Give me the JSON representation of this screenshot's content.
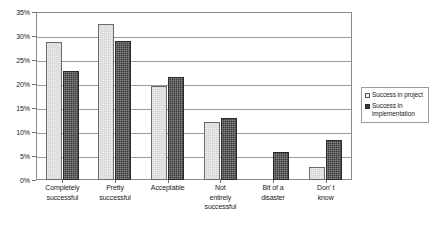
{
  "chart_data": {
    "type": "bar",
    "title": "",
    "subtitle": "",
    "xlabel": "",
    "ylabel": "",
    "ylim": [
      0,
      35
    ],
    "y_tick_step": 5,
    "y_tick_labels": [
      "0%",
      "5%",
      "10%",
      "15%",
      "20%",
      "25%",
      "30%",
      "35%"
    ],
    "y_tick_values": [
      0,
      5,
      10,
      15,
      20,
      25,
      30,
      35
    ],
    "grid": true,
    "grid_axis": "y",
    "legend_position": "right",
    "categories": [
      "Completely successful",
      "Pretty successful",
      "Acceptable",
      "Not entirely successful",
      "Bit of a disaster",
      "Don' t know"
    ],
    "category_lines": [
      [
        "Completely",
        "successful"
      ],
      [
        "Pretty",
        "successful"
      ],
      [
        "Acceptable"
      ],
      [
        "Not",
        "entirely",
        "successful"
      ],
      [
        "Bit of a",
        "disaster"
      ],
      [
        "Don' t",
        "know"
      ]
    ],
    "series": [
      {
        "name": "Success in project",
        "color": "#ededed",
        "values": [
          28.8,
          32.5,
          19.5,
          12.0,
          0.0,
          2.8
        ]
      },
      {
        "name": "Success in implementation",
        "color": "#3a3a3a",
        "values": [
          22.8,
          28.9,
          21.5,
          13.0,
          5.8,
          8.4
        ]
      }
    ]
  },
  "legend": {
    "items": [
      {
        "label": "Success in project",
        "swatch": "light"
      },
      {
        "label": "Success in implementation",
        "swatch": "dark"
      }
    ]
  }
}
